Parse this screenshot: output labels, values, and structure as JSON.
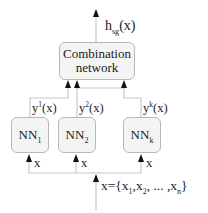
{
  "diagram": {
    "type": "ensemble-neural-network",
    "output": {
      "symbol": "h",
      "subscript": "sg",
      "arg": "(x)"
    },
    "combination_box": {
      "line1": "Combination",
      "line2": "network"
    },
    "networks": [
      {
        "name": "NN",
        "index": "1",
        "output_symbol": "y",
        "output_sup": "1",
        "output_arg": "(x)",
        "input": "x"
      },
      {
        "name": "NN",
        "index": "2",
        "output_symbol": "y",
        "output_sup": "2",
        "output_arg": "(x)",
        "input": "x"
      },
      {
        "name": "NN",
        "index": "k",
        "output_symbol": "y",
        "output_sup": "k",
        "output_arg": "(x)",
        "input": "x"
      }
    ],
    "input": {
      "prefix": "x={x",
      "s1": "1",
      "sep1": ",x",
      "s2": "2",
      "sep2": ", ... ,x",
      "sn": "n",
      "suffix": "}"
    },
    "colors": {
      "line": "#c8c8c8",
      "arrow": "#111111",
      "box_fill": "#f4f4f4",
      "box_border": "#b8b8b8"
    }
  }
}
